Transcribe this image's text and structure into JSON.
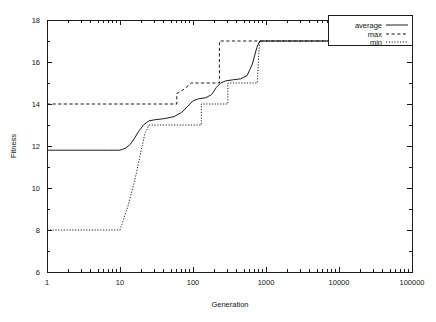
{
  "chart_data": {
    "type": "line",
    "title": "",
    "xlabel": "Generation",
    "ylabel": "Fitness",
    "xscale": "log",
    "yscale": "linear",
    "xlim": [
      1,
      100000
    ],
    "ylim": [
      6,
      18
    ],
    "xticks": [
      1,
      10,
      100,
      1000,
      10000,
      100000
    ],
    "xtick_labels": [
      "1",
      "10",
      "100",
      "1000",
      "10000",
      "100000"
    ],
    "yticks": [
      6,
      8,
      10,
      12,
      14,
      16,
      18
    ],
    "ytick_labels": [
      "6",
      "8",
      "10",
      "12",
      "14",
      "16",
      "18"
    ],
    "grid": false,
    "legend_position": "top-right",
    "series": [
      {
        "name": "average",
        "style": "solid",
        "color": "#1d1d1d",
        "points": [
          [
            1,
            11.8
          ],
          [
            2,
            11.8
          ],
          [
            4,
            11.8
          ],
          [
            7,
            11.8
          ],
          [
            10,
            11.8
          ],
          [
            12,
            11.9
          ],
          [
            14,
            12.1
          ],
          [
            16,
            12.4
          ],
          [
            18,
            12.7
          ],
          [
            21,
            13.0
          ],
          [
            25,
            13.2
          ],
          [
            30,
            13.25
          ],
          [
            40,
            13.3
          ],
          [
            55,
            13.4
          ],
          [
            70,
            13.6
          ],
          [
            85,
            13.9
          ],
          [
            100,
            14.15
          ],
          [
            120,
            14.25
          ],
          [
            150,
            14.3
          ],
          [
            180,
            14.45
          ],
          [
            210,
            14.8
          ],
          [
            240,
            15.0
          ],
          [
            280,
            15.1
          ],
          [
            350,
            15.15
          ],
          [
            450,
            15.2
          ],
          [
            550,
            15.35
          ],
          [
            650,
            15.9
          ],
          [
            750,
            16.7
          ],
          [
            820,
            17.0
          ],
          [
            1000,
            17.0
          ],
          [
            3000,
            17.0
          ],
          [
            10000,
            17.0
          ],
          [
            40000,
            17.0
          ],
          [
            100000,
            17.0
          ]
        ]
      },
      {
        "name": "max",
        "style": "dashed",
        "color": "#1d1d1d",
        "points": [
          [
            1,
            14.0
          ],
          [
            10,
            14.0
          ],
          [
            40,
            14.0
          ],
          [
            60,
            14.0
          ],
          [
            60,
            14.5
          ],
          [
            75,
            14.7
          ],
          [
            95,
            15.0
          ],
          [
            120,
            15.0
          ],
          [
            180,
            15.0
          ],
          [
            230,
            15.0
          ],
          [
            230,
            17.0
          ],
          [
            300,
            17.0
          ],
          [
            1000,
            17.0
          ],
          [
            5000,
            17.0
          ],
          [
            20000,
            17.0
          ],
          [
            100000,
            17.0
          ]
        ]
      },
      {
        "name": "min",
        "style": "dotted",
        "color": "#1d1d1d",
        "points": [
          [
            1,
            8.0
          ],
          [
            3,
            8.0
          ],
          [
            6,
            8.0
          ],
          [
            10,
            8.0
          ],
          [
            13,
            9.2
          ],
          [
            16,
            10.4
          ],
          [
            19,
            11.6
          ],
          [
            22,
            12.6
          ],
          [
            25,
            13.0
          ],
          [
            40,
            13.0
          ],
          [
            70,
            13.0
          ],
          [
            110,
            13.0
          ],
          [
            130,
            13.0
          ],
          [
            130,
            14.0
          ],
          [
            180,
            14.0
          ],
          [
            240,
            14.0
          ],
          [
            300,
            14.0
          ],
          [
            300,
            15.0
          ],
          [
            400,
            15.0
          ],
          [
            550,
            15.0
          ],
          [
            700,
            15.0
          ],
          [
            760,
            15.0
          ],
          [
            790,
            16.2
          ],
          [
            820,
            17.0
          ],
          [
            1200,
            17.0
          ],
          [
            6000,
            17.0
          ],
          [
            30000,
            17.0
          ],
          [
            100000,
            17.0
          ]
        ]
      }
    ]
  },
  "legend": {
    "entries": [
      {
        "label": "average",
        "style": "solid"
      },
      {
        "label": "max",
        "style": "dashed"
      },
      {
        "label": "min",
        "style": "dotted"
      }
    ]
  }
}
